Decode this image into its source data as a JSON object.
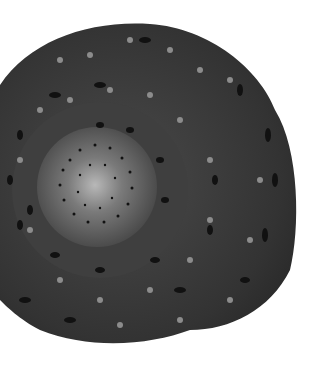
{
  "image": {
    "subject": "snail shell viewed from apex",
    "background": "#ffffff",
    "shell_color": "#3a3a3a",
    "spot_light_color": "#8a8a8a",
    "spot_dark_color": "#111111",
    "apex_color": "#b5b5b5"
  }
}
